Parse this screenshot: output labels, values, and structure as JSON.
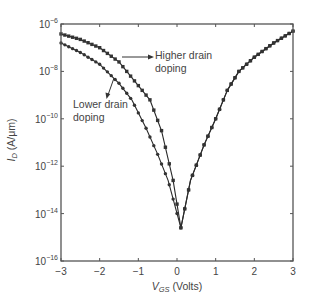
{
  "chart_data": {
    "type": "line",
    "title": "",
    "xlabel": "V_GS (Volts)",
    "xlabel_main": "V",
    "xlabel_sub": "GS",
    "xlabel_rest": " (Volts)",
    "ylabel": "I_D (A/μm)",
    "ylabel_main": "I",
    "ylabel_sub": "D",
    "ylabel_rest": " (A/μm)",
    "yscale": "log",
    "xlim": [
      -3,
      3
    ],
    "ylim": [
      1e-16,
      1e-06
    ],
    "x_ticks": [
      "-3",
      "-2",
      "-1",
      "0",
      "1",
      "2",
      "3"
    ],
    "x_tick_values": [
      -3,
      -2,
      -1,
      0,
      1,
      2,
      3
    ],
    "y_ticks": [
      "10^-6",
      "10^-8",
      "10^-10",
      "10^-12",
      "10^-14",
      "10^-16"
    ],
    "y_tick_exponents": [
      -6,
      -8,
      -10,
      -12,
      -14,
      -16
    ],
    "y_tick_base": "10",
    "grid": false,
    "legend": "none (inline annotations)",
    "series": [
      {
        "name": "Higher drain doping",
        "marker": "square",
        "x": [
          -3.0,
          -2.5,
          -2.0,
          -1.5,
          -1.0,
          -0.7,
          -0.4,
          -0.1,
          0.1,
          0.35,
          0.7,
          1.0,
          1.3,
          1.6,
          2.0,
          2.5,
          3.0
        ],
        "log10_y": [
          -6.42,
          -6.65,
          -7.0,
          -7.6,
          -8.6,
          -9.2,
          -10.5,
          -12.6,
          -14.6,
          -12.6,
          -11.1,
          -10.0,
          -8.8,
          -8.0,
          -7.4,
          -6.8,
          -6.3
        ]
      },
      {
        "name": "Lower drain doping",
        "marker": "circle",
        "x": [
          -3.0,
          -2.5,
          -2.0,
          -1.5,
          -1.17,
          -0.8,
          -0.5,
          -0.23,
          0.1,
          0.35,
          0.7,
          1.0,
          1.3,
          1.6,
          2.0,
          2.5,
          3.0
        ],
        "log10_y": [
          -6.8,
          -7.2,
          -7.7,
          -8.5,
          -9.2,
          -10.4,
          -11.5,
          -12.6,
          -14.6,
          -12.6,
          -11.1,
          -10.0,
          -8.8,
          -8.0,
          -7.4,
          -6.8,
          -6.3
        ]
      }
    ],
    "annotations": [
      {
        "text_line1": "Higher drain",
        "text_line2": "doping",
        "target_series": "Higher drain doping"
      },
      {
        "text_line1": "Lower drain",
        "text_line2": "doping",
        "target_series": "Lower drain doping"
      }
    ],
    "colors": {
      "line": "#2a2a2a",
      "marker": "#333333",
      "axis": "#555555",
      "text": "#444444"
    }
  }
}
